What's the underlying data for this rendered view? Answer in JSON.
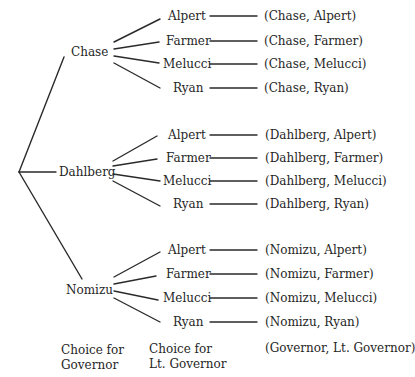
{
  "governors": [
    {
      "name": "Chase",
      "lt_governors": [
        "Alpert",
        "Farmer",
        "Melucci",
        "Ryan"
      ],
      "outcomes": [
        "(Chase, Alpert)",
        "(Chase, Farmer)",
        "(Chase, Melucci)",
        "(Chase, Ryan)"
      ]
    },
    {
      "name": "Dahlberg",
      "lt_governors": [
        "Alpert",
        "Farmer",
        "Melucci",
        "Ryan"
      ],
      "outcomes": [
        "(Dahlberg, Alpert)",
        "(Dahlberg, Farmer)",
        "(Dahlberg, Melucci)",
        "(Dahlberg, Ryan)"
      ]
    },
    {
      "name": "Nomizu",
      "lt_governors": [
        "Alpert",
        "Farmer",
        "Melucci",
        "Ryan"
      ],
      "outcomes": [
        "(Nomizu, Alpert)",
        "(Nomizu, Farmer)",
        "(Nomizu, Melucci)",
        "(Nomizu, Ryan)"
      ]
    }
  ],
  "captions": {
    "governor_line1": "Choice for",
    "governor_line2": "Governor",
    "lt_governor_line1": "Choice for",
    "lt_governor_line2": "Lt. Governor",
    "outcome_format": "(Governor, Lt. Governor)"
  },
  "colors": {
    "line": "#2a2a2a",
    "text": "#262626",
    "background": "#ffffff"
  }
}
